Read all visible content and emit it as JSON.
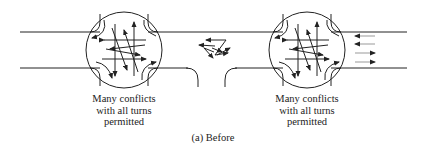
{
  "figure": {
    "label": "(a) Before",
    "left_intersection": {
      "caption_lines": [
        "Many conflicts",
        "with all turns",
        "permitted"
      ]
    },
    "right_intersection": {
      "caption_lines": [
        "Many conflicts",
        "with all turns",
        "permitted"
      ]
    },
    "colors": {
      "stroke": "#222222",
      "background": "#ffffff"
    }
  }
}
